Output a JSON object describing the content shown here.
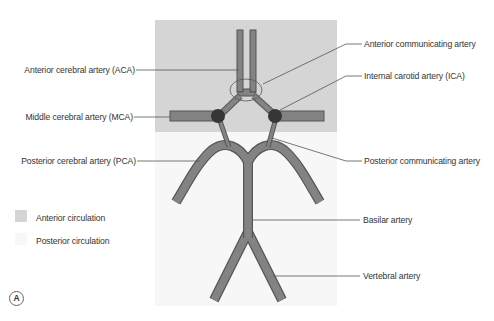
{
  "figure": {
    "panel_letter": "A",
    "colors": {
      "anterior_region": "#d5d5d5",
      "posterior_region": "#f7f7f7",
      "artery_fill": "#838383",
      "artery_outline": "#555555",
      "junction_node": "#363636",
      "leader_line": "#555555",
      "label_text": "#333333"
    }
  },
  "labels": {
    "left": [
      {
        "id": "aca",
        "text": "Anterior cerebral artery (ACA)"
      },
      {
        "id": "mca",
        "text": "Middle cerebral artery (MCA)"
      },
      {
        "id": "pca",
        "text": "Posterior cerebral artery (PCA)"
      }
    ],
    "right": [
      {
        "id": "acoa",
        "text": "Anterior communicating artery"
      },
      {
        "id": "ica",
        "text": "Internal carotid artery (ICA)"
      },
      {
        "id": "pcoa",
        "text": "Posterior communicating artery"
      },
      {
        "id": "basilar",
        "text": "Basilar artery"
      },
      {
        "id": "vertebral",
        "text": "Vertebral artery"
      }
    ]
  },
  "legend": [
    {
      "label": "Anterior circulation",
      "swatch": "#d5d5d5"
    },
    {
      "label": "Posterior circulation",
      "swatch": "#f7f7f7"
    }
  ]
}
